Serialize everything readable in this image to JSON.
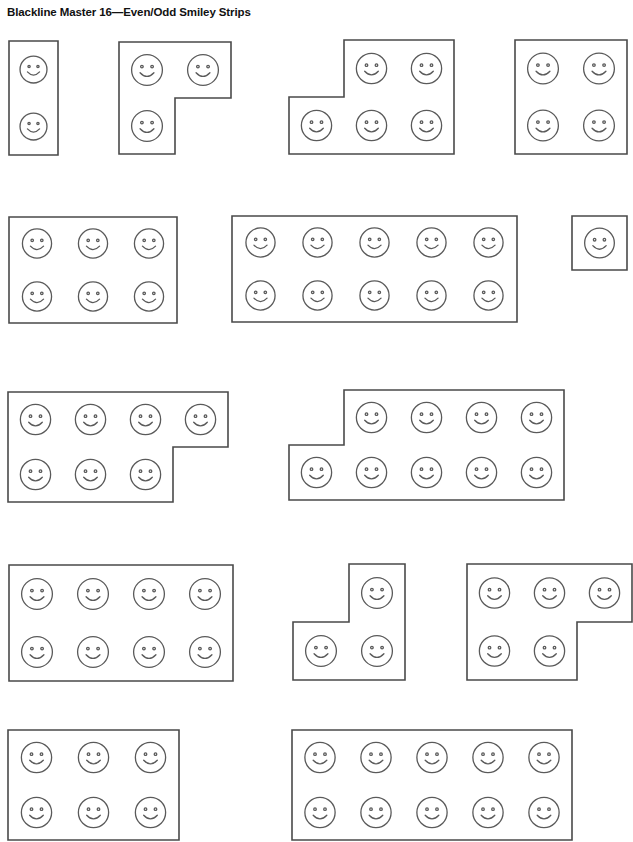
{
  "page": {
    "title": "Blackline Master 16—Even/Odd Smiley Strips",
    "width": 633,
    "height": 740,
    "background_color": "#ffffff",
    "outline_color": "#4a4a4a",
    "face_color": "#5a5a5a",
    "face_icon_name": "smiley-face-icon"
  },
  "strips": [
    {
      "id": "strip-1",
      "label": "2-smiley vertical strip",
      "count": 2,
      "parity": "even",
      "shape": "rectangle",
      "x": 7,
      "y": 39,
      "cols": 1,
      "rows": 2,
      "cell_w": 49,
      "cell_h": 57,
      "top_row_cells": [
        0
      ],
      "bottom_row_cells": [
        0
      ]
    },
    {
      "id": "strip-2",
      "label": "3-smiley L strip",
      "count": 3,
      "parity": "odd",
      "shape": "l-shape-bottom-left",
      "x": 117,
      "y": 40,
      "cols": 2,
      "rows": 2,
      "cell_w": 56,
      "cell_h": 56,
      "top_row_cells": [
        0,
        1
      ],
      "bottom_row_cells": [
        0
      ]
    },
    {
      "id": "strip-3",
      "label": "5-smiley L strip",
      "count": 5,
      "parity": "odd",
      "shape": "l-shape-notch-top-left",
      "x": 287,
      "y": 38,
      "cols": 3,
      "rows": 2,
      "cell_w": 55,
      "cell_h": 57,
      "top_row_cells": [
        1,
        2
      ],
      "bottom_row_cells": [
        0,
        1,
        2
      ]
    },
    {
      "id": "strip-4",
      "label": "4-smiley square strip",
      "count": 4,
      "parity": "even",
      "shape": "rectangle",
      "x": 513,
      "y": 38,
      "cols": 2,
      "rows": 2,
      "cell_w": 56,
      "cell_h": 57,
      "top_row_cells": [
        0,
        1
      ],
      "bottom_row_cells": [
        0,
        1
      ]
    },
    {
      "id": "strip-5",
      "label": "6-smiley rectangle strip",
      "count": 6,
      "parity": "even",
      "shape": "rectangle",
      "x": 7,
      "y": 215,
      "cols": 3,
      "rows": 2,
      "cell_w": 56,
      "cell_h": 53,
      "top_row_cells": [
        0,
        1,
        2
      ],
      "bottom_row_cells": [
        0,
        1,
        2
      ]
    },
    {
      "id": "strip-6",
      "label": "10-smiley rectangle strip",
      "count": 10,
      "parity": "even",
      "shape": "rectangle",
      "x": 230,
      "y": 214,
      "cols": 5,
      "rows": 2,
      "cell_w": 57,
      "cell_h": 53,
      "top_row_cells": [
        0,
        1,
        2,
        3,
        4
      ],
      "bottom_row_cells": [
        0,
        1,
        2,
        3,
        4
      ]
    },
    {
      "id": "strip-7",
      "label": "1-smiley single strip",
      "count": 1,
      "parity": "odd",
      "shape": "rectangle",
      "x": 570,
      "y": 214,
      "cols": 1,
      "rows": 1,
      "cell_w": 55,
      "cell_h": 54,
      "top_row_cells": [
        0
      ],
      "bottom_row_cells": []
    },
    {
      "id": "strip-8",
      "label": "7-smiley L strip",
      "count": 7,
      "parity": "odd",
      "shape": "l-shape-notch-bottom-right",
      "x": 6,
      "y": 390,
      "cols": 4,
      "rows": 2,
      "cell_w": 55,
      "cell_h": 55,
      "top_row_cells": [
        0,
        1,
        2,
        3
      ],
      "bottom_row_cells": [
        0,
        1,
        2
      ]
    },
    {
      "id": "strip-9",
      "label": "9-smiley L strip",
      "count": 9,
      "parity": "odd",
      "shape": "l-shape-notch-top-left",
      "x": 287,
      "y": 388,
      "cols": 5,
      "rows": 2,
      "cell_w": 55,
      "cell_h": 55,
      "top_row_cells": [
        1,
        2,
        3,
        4
      ],
      "bottom_row_cells": [
        0,
        1,
        2,
        3,
        4
      ]
    },
    {
      "id": "strip-10",
      "label": "8-smiley rectangle strip",
      "count": 8,
      "parity": "even",
      "shape": "rectangle",
      "x": 7,
      "y": 563,
      "cols": 4,
      "rows": 2,
      "cell_w": 56,
      "cell_h": 58,
      "top_row_cells": [
        0,
        1,
        2,
        3
      ],
      "bottom_row_cells": [
        0,
        1,
        2,
        3
      ]
    },
    {
      "id": "strip-11",
      "label": "3-smiley L strip lower",
      "count": 3,
      "parity": "odd",
      "shape": "l-shape-notch-top-left",
      "x": 291,
      "y": 562,
      "cols": 2,
      "rows": 2,
      "cell_w": 56,
      "cell_h": 58,
      "top_row_cells": [
        1
      ],
      "bottom_row_cells": [
        0,
        1
      ]
    },
    {
      "id": "strip-12",
      "label": "5-smiley L strip lower",
      "count": 5,
      "parity": "odd",
      "shape": "l-shape-notch-bottom-right",
      "x": 465,
      "y": 562,
      "cols": 3,
      "rows": 2,
      "cell_w": 55,
      "cell_h": 58,
      "top_row_cells": [
        0,
        1,
        2
      ],
      "bottom_row_cells": [
        0,
        1
      ]
    },
    {
      "id": "strip-13",
      "label": "partial strip bottom left",
      "count": 0,
      "parity": "unknown",
      "shape": "rectangle",
      "x": 6,
      "y": 728,
      "cols": 3,
      "rows": 2,
      "cell_w": 57,
      "cell_h": 55,
      "top_row_cells": [
        0,
        1,
        2
      ],
      "bottom_row_cells": [
        0,
        1,
        2
      ]
    },
    {
      "id": "strip-14",
      "label": "partial strip bottom right",
      "count": 0,
      "parity": "unknown",
      "shape": "rectangle",
      "x": 290,
      "y": 728,
      "cols": 5,
      "rows": 2,
      "cell_w": 56,
      "cell_h": 55,
      "top_row_cells": [
        0,
        1,
        2,
        3,
        4
      ],
      "bottom_row_cells": [
        0,
        1,
        2,
        3,
        4
      ]
    }
  ]
}
